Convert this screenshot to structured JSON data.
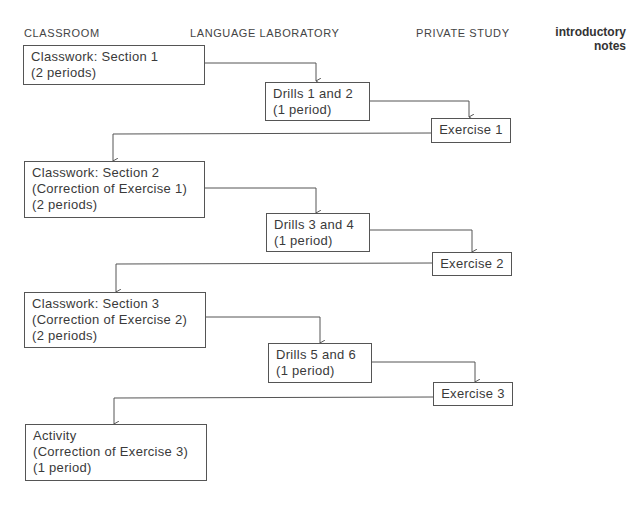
{
  "headers": {
    "classroom": "CLASSROOM",
    "language_lab": "LANGUAGE LABORATORY",
    "private_study": "PRIVATE STUDY",
    "notes_line1": "introductory",
    "notes_line2": "notes"
  },
  "boxes": {
    "classwork1": [
      "Classwork: Section 1",
      "(2 periods)"
    ],
    "drills12": [
      "Drills 1 and 2",
      "(1 period)"
    ],
    "exercise1": [
      "Exercise 1"
    ],
    "classwork2": [
      "Classwork: Section 2",
      "(Correction of Exercise 1)",
      "(2 periods)"
    ],
    "drills34": [
      "Drills 3 and 4",
      "(1 period)"
    ],
    "exercise2": [
      "Exercise 2"
    ],
    "classwork3": [
      "Classwork: Section 3",
      "(Correction of Exercise 2)",
      "(2 periods)"
    ],
    "drills56": [
      "Drills 5 and 6",
      "(1 period)"
    ],
    "exercise3": [
      "Exercise 3"
    ],
    "activity": [
      "Activity",
      "(Correction of Exercise 3)",
      "(1 period)"
    ]
  },
  "colors": {
    "line": "#555555",
    "text": "#3a3a3a"
  }
}
